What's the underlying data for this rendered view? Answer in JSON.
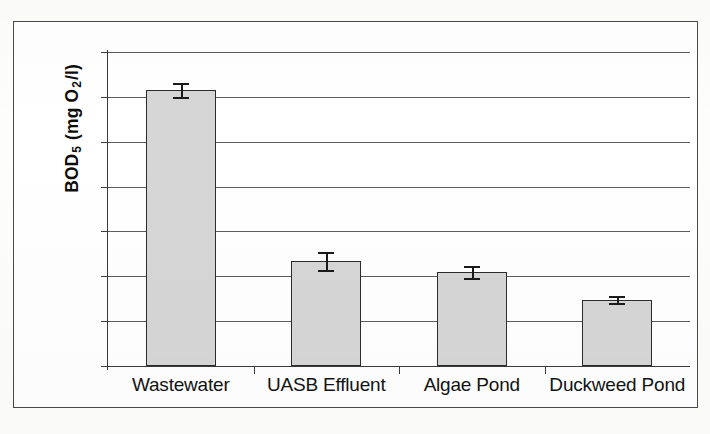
{
  "chart_data": {
    "type": "bar",
    "title": "",
    "xlabel": "",
    "ylabel": "BOD 5 (mg O2/l)",
    "ylabel_parts": {
      "prefix": "BOD",
      "sub1": "5",
      "mid": " (mg O",
      "sub2": "2",
      "suffix": "/l)"
    },
    "categories": [
      "Wastewater",
      "UASB Effluent",
      "Algae Pond",
      "Duckweed Pond"
    ],
    "values": [
      308,
      117,
      105,
      74
    ],
    "errors": [
      8,
      10,
      7,
      4
    ],
    "ylim": [
      0,
      350
    ],
    "yticks": [
      0,
      50,
      100,
      150,
      200,
      250,
      300,
      350
    ],
    "ytick_labels": [
      "0",
      "50",
      "100",
      "150",
      "200",
      "250",
      "300",
      "350"
    ],
    "grid": true,
    "legend": "none",
    "bar_fill": "#d6d6d6",
    "bar_stroke": "#2c2c2c",
    "axis_color": "#3a3a3a"
  },
  "figure": {
    "frame_color": "#4a4a4a",
    "background": "#ffffff"
  }
}
